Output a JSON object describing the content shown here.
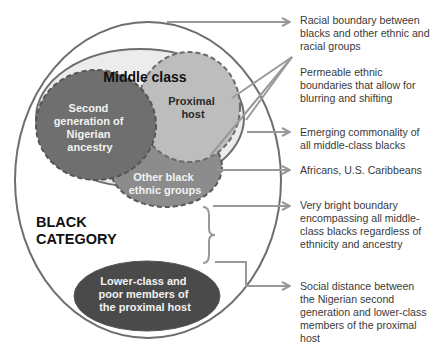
{
  "diagram": {
    "outer_label": [
      "BLACK",
      "CATEGORY"
    ],
    "middle_class_label": "Middle class",
    "groups": {
      "second_generation": [
        "Second",
        "generation of",
        "Nigerian",
        "ancestry"
      ],
      "proximal_host": [
        "Proximal",
        "host"
      ],
      "other_black": [
        "Other black",
        "ethnic groups"
      ],
      "lower_class": [
        "Lower-class and",
        "poor members of",
        "the proximal host"
      ]
    },
    "annotations": [
      "Racial boundary between blacks and other ethnic and racial groups",
      "Permeable ethnic boundaries that allow for blurring and shifting",
      "Emerging commonality of all middle-class blacks",
      "Africans, U.S. Caribbeans",
      "Very bright boundary encompassing all middle-class blacks regardless of ethnicity and ancestry",
      "Social distance between the Nigerian second generation and lower-class members of the proximal host"
    ],
    "colors": {
      "outer_stroke": "#6e6e6e",
      "middle_class_fill": "#ececec",
      "second_generation_fill": "#6f6f6f",
      "proximal_host_fill": "#bdbdbd",
      "other_black_fill": "#8c8c8c",
      "lower_class_fill": "#4a4a4a",
      "arrow": "#999999"
    }
  }
}
